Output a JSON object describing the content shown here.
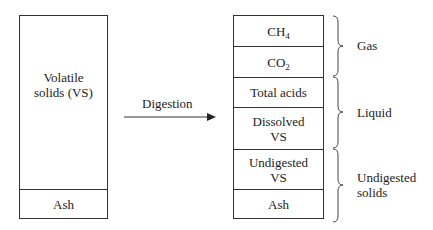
{
  "left_column": {
    "cells": [
      {
        "label_line1": "Volatile",
        "label_line2": "solids (VS)"
      },
      {
        "label": "Ash"
      }
    ]
  },
  "arrow": {
    "label": "Digestion"
  },
  "right_column": {
    "cells": [
      {
        "label_main": "CH",
        "label_sub": "4"
      },
      {
        "label_main": "CO",
        "label_sub": "2"
      },
      {
        "label": "Total acids"
      },
      {
        "label_line1": "Dissolved",
        "label_line2": "VS"
      },
      {
        "label_line1": "Undigested",
        "label_line2": "VS"
      },
      {
        "label": "Ash"
      }
    ]
  },
  "groups": [
    {
      "label": "Gas"
    },
    {
      "label": "Liquid"
    },
    {
      "label_line1": "Undigested",
      "label_line2": "solids"
    }
  ],
  "colors": {
    "stroke": "#333333",
    "background": "#ffffff",
    "text": "#222222"
  }
}
